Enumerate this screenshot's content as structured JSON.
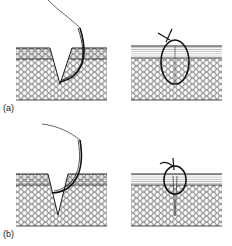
{
  "figure": {
    "panels": [
      {
        "id": "a",
        "label": "(a)",
        "caption_left": "needle passing through V-shaped wound",
        "caption_right": "tied simple suture, full depth"
      },
      {
        "id": "b",
        "label": "(b)",
        "caption_left": "needle passing superficially",
        "caption_right": "tied suture with dead space beneath"
      }
    ]
  },
  "colors": {
    "ink": "#1a1a1a",
    "background": "#ffffff"
  }
}
